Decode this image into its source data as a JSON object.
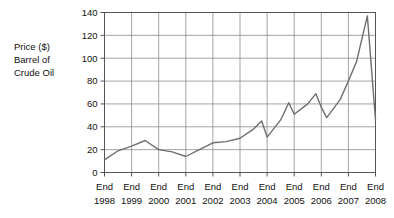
{
  "chart_data": {
    "type": "line",
    "title": "",
    "subtitle": "",
    "xlabel": "",
    "ylabel": "Price ($) Barrel of Crude Oil",
    "ylabel_lines": [
      "Price ($)",
      "Barrel of",
      "Crude Oil"
    ],
    "ylim": [
      0,
      140
    ],
    "yticks": [
      0,
      20,
      40,
      60,
      80,
      100,
      120,
      140
    ],
    "ytick_labels": [
      "0",
      "20",
      "40",
      "60",
      "80",
      "100",
      "120",
      "140"
    ],
    "grid": true,
    "legend": null,
    "legend_position": "none",
    "categories": [
      "End 1998",
      "End 1999",
      "End 2000",
      "End 2001",
      "End 2002",
      "End 2003",
      "End 2004",
      "End 2005",
      "End 2006",
      "End 2007",
      "End 2008"
    ],
    "xtick_labels_top": [
      "End",
      "End",
      "End",
      "End",
      "End",
      "End",
      "End",
      "End",
      "End",
      "End",
      "End"
    ],
    "xtick_labels_bottom": [
      "1998",
      "1999",
      "2000",
      "2001",
      "2002",
      "2003",
      "2004",
      "2005",
      "2006",
      "2007",
      "2008"
    ],
    "series": [
      {
        "name": "Crude Oil Price",
        "color": "#6e6e6e",
        "points": [
          {
            "x": 1998.0,
            "y": 11
          },
          {
            "x": 1998.5,
            "y": 19
          },
          {
            "x": 1999.0,
            "y": 23
          },
          {
            "x": 1999.5,
            "y": 28
          },
          {
            "x": 2000.0,
            "y": 20
          },
          {
            "x": 2000.5,
            "y": 18
          },
          {
            "x": 2001.0,
            "y": 14
          },
          {
            "x": 2001.5,
            "y": 20
          },
          {
            "x": 2002.0,
            "y": 26
          },
          {
            "x": 2002.5,
            "y": 27
          },
          {
            "x": 2003.0,
            "y": 30
          },
          {
            "x": 2003.5,
            "y": 38
          },
          {
            "x": 2003.8,
            "y": 45
          },
          {
            "x": 2004.0,
            "y": 31
          },
          {
            "x": 2004.5,
            "y": 46
          },
          {
            "x": 2004.8,
            "y": 61
          },
          {
            "x": 2005.0,
            "y": 51
          },
          {
            "x": 2005.5,
            "y": 60
          },
          {
            "x": 2005.8,
            "y": 69
          },
          {
            "x": 2006.0,
            "y": 57
          },
          {
            "x": 2006.2,
            "y": 48
          },
          {
            "x": 2006.7,
            "y": 64
          },
          {
            "x": 2007.0,
            "y": 80
          },
          {
            "x": 2007.3,
            "y": 97
          },
          {
            "x": 2007.7,
            "y": 137
          },
          {
            "x": 2008.0,
            "y": 46
          }
        ]
      }
    ],
    "annotations": []
  }
}
